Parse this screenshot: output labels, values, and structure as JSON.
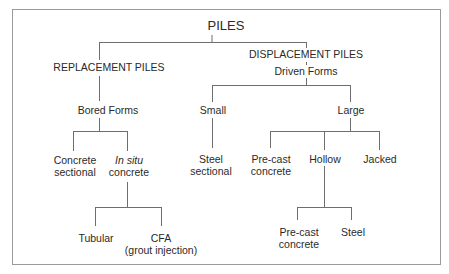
{
  "diagram": {
    "title": "PILES",
    "line_color": "#6e6e6e",
    "border_color": "#9a9a9a",
    "nodes": {
      "root": {
        "label": "PILES"
      },
      "replacement": {
        "label": "REPLACEMENT PILES"
      },
      "displacement": {
        "label": "DISPLACEMENT PILES"
      },
      "driven_forms": {
        "label": "Driven Forms"
      },
      "bored_forms": {
        "label": "Bored Forms"
      },
      "small": {
        "label": "Small"
      },
      "large": {
        "label": "Large"
      },
      "concrete_sectional": {
        "line1": "Concrete",
        "line2": "sectional"
      },
      "in_situ_concrete": {
        "line1": "In situ",
        "line2": "concrete"
      },
      "steel_sectional": {
        "line1": "Steel",
        "line2": "sectional"
      },
      "precast_concrete": {
        "line1": "Pre-cast",
        "line2": "concrete"
      },
      "hollow": {
        "label": "Hollow"
      },
      "jacked": {
        "label": "Jacked"
      },
      "tubular": {
        "label": "Tubular"
      },
      "cfa": {
        "line1": "CFA",
        "line2": "(grout injection)"
      },
      "hollow_precast": {
        "line1": "Pre-cast",
        "line2": "concrete"
      },
      "hollow_steel": {
        "label": "Steel"
      }
    },
    "edges": [
      [
        "PILES",
        "REPLACEMENT PILES"
      ],
      [
        "PILES",
        "DISPLACEMENT PILES"
      ],
      [
        "REPLACEMENT PILES",
        "Bored Forms"
      ],
      [
        "DISPLACEMENT PILES",
        "Driven Forms"
      ],
      [
        "Driven Forms",
        "Small"
      ],
      [
        "Driven Forms",
        "Large"
      ],
      [
        "Bored Forms",
        "Concrete sectional"
      ],
      [
        "Bored Forms",
        "In situ concrete"
      ],
      [
        "Small",
        "Steel sectional"
      ],
      [
        "Large",
        "Pre-cast concrete"
      ],
      [
        "Large",
        "Hollow"
      ],
      [
        "Large",
        "Jacked"
      ],
      [
        "In situ concrete",
        "Tubular"
      ],
      [
        "In situ concrete",
        "CFA (grout injection)"
      ],
      [
        "Hollow",
        "Pre-cast concrete"
      ],
      [
        "Hollow",
        "Steel"
      ]
    ]
  }
}
